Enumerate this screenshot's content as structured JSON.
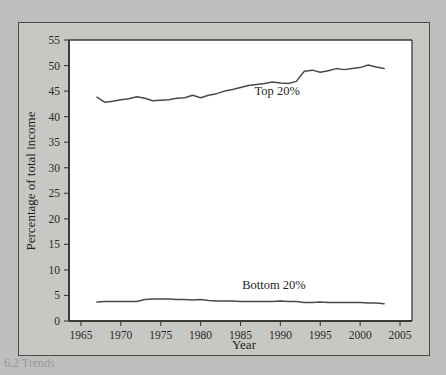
{
  "figure": {
    "background_color": "#bebebc",
    "panel_color": "#c7c7c4",
    "plot_area_color": "#ffffff",
    "line_color": "#4a4a48",
    "caption_partial": "6.2  Trends"
  },
  "chart_data": {
    "type": "line",
    "title": "",
    "xlabel": "Year",
    "ylabel": "Percentage of total income",
    "xlim": [
      1963.5,
      2006.5
    ],
    "ylim": [
      0,
      55
    ],
    "xticks": [
      1965,
      1970,
      1975,
      1980,
      1985,
      1990,
      1995,
      2000,
      2005
    ],
    "yticks": [
      0,
      5,
      10,
      15,
      20,
      25,
      30,
      35,
      40,
      45,
      50,
      55
    ],
    "grid": false,
    "legend": "inline-annotations",
    "x": [
      1967,
      1968,
      1969,
      1970,
      1971,
      1972,
      1973,
      1974,
      1975,
      1976,
      1977,
      1978,
      1979,
      1980,
      1981,
      1982,
      1983,
      1984,
      1985,
      1986,
      1987,
      1988,
      1989,
      1990,
      1991,
      1992,
      1993,
      1994,
      1995,
      1996,
      1997,
      1998,
      1999,
      2000,
      2001,
      2002,
      2003
    ],
    "series": [
      {
        "name": "Top 20%",
        "label": "Top 20%",
        "label_x": 1989.6,
        "label_y": 44.3,
        "values": [
          43.8,
          42.8,
          43.0,
          43.3,
          43.5,
          43.9,
          43.6,
          43.1,
          43.2,
          43.3,
          43.6,
          43.7,
          44.2,
          43.7,
          44.2,
          44.5,
          45.0,
          45.3,
          45.7,
          46.1,
          46.3,
          46.5,
          46.8,
          46.6,
          46.5,
          46.9,
          48.9,
          49.1,
          48.7,
          49.0,
          49.4,
          49.2,
          49.4,
          49.6,
          50.1,
          49.7,
          49.4
        ]
      },
      {
        "name": "Bottom 20%",
        "label": "Bottom 20%",
        "label_x": 1989.2,
        "label_y": 6.2,
        "values": [
          3.7,
          3.8,
          3.8,
          3.8,
          3.8,
          3.8,
          4.2,
          4.3,
          4.3,
          4.3,
          4.2,
          4.2,
          4.1,
          4.2,
          4.0,
          3.9,
          3.9,
          3.9,
          3.8,
          3.8,
          3.8,
          3.8,
          3.8,
          3.9,
          3.8,
          3.8,
          3.6,
          3.6,
          3.7,
          3.6,
          3.6,
          3.6,
          3.6,
          3.6,
          3.5,
          3.5,
          3.4
        ]
      }
    ]
  }
}
